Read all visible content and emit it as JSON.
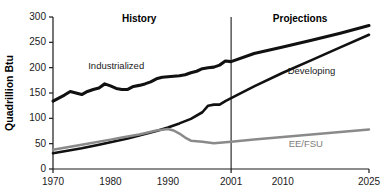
{
  "chart_data": {
    "type": "line",
    "title": "",
    "xlabel": "",
    "ylabel": "Quadrillion Btu",
    "xlim": [
      1970,
      2025
    ],
    "ylim": [
      0,
      300
    ],
    "grid": false,
    "legend_position": "inline-annotations",
    "y_ticks": [
      0,
      50,
      100,
      150,
      200,
      250,
      300
    ],
    "y_tick_labels": [
      "0",
      "50",
      "100",
      "150",
      "200",
      "250",
      "300"
    ],
    "x_ticks": [
      1970,
      1980,
      1990,
      2001,
      2010,
      2025
    ],
    "x_tick_labels": [
      "1970",
      "1980",
      "1990",
      "2001",
      "2010",
      "2025"
    ],
    "annotations": [
      {
        "name": "history-label",
        "text": "History",
        "x": 1985,
        "y": 290
      },
      {
        "name": "projections-label",
        "text": "Projections",
        "x": 2013,
        "y": 290
      },
      {
        "name": "divider-2001",
        "text": "2001",
        "x": 2001
      }
    ],
    "series": [
      {
        "name": "Industrialized",
        "color": "#111111",
        "label_x": 1981,
        "label_y": 198,
        "x": [
          1970,
          1971,
          1972,
          1973,
          1974,
          1975,
          1976,
          1977,
          1978,
          1979,
          1980,
          1981,
          1982,
          1983,
          1984,
          1985,
          1986,
          1987,
          1988,
          1989,
          1990,
          1991,
          1992,
          1993,
          1994,
          1995,
          1996,
          1997,
          1998,
          1999,
          2000,
          2001,
          2005,
          2010,
          2015,
          2020,
          2025
        ],
        "values": [
          134,
          140,
          146,
          153,
          150,
          147,
          153,
          157,
          160,
          168,
          164,
          159,
          157,
          157,
          163,
          165,
          168,
          172,
          178,
          181,
          182,
          183,
          184,
          186,
          190,
          193,
          198,
          200,
          201,
          205,
          213,
          212,
          228,
          241,
          254,
          268,
          283
        ]
      },
      {
        "name": "Developing",
        "color": "#111111",
        "label_x": 2015,
        "label_y": 188,
        "x": [
          1970,
          1973,
          1975,
          1978,
          1980,
          1983,
          1985,
          1988,
          1990,
          1992,
          1994,
          1996,
          1997,
          1998,
          1999,
          2000,
          2001,
          2005,
          2010,
          2015,
          2020,
          2025
        ],
        "values": [
          31,
          37,
          41,
          48,
          53,
          60,
          66,
          75,
          82,
          90,
          99,
          112,
          125,
          127,
          127,
          134,
          140,
          163,
          190,
          215,
          240,
          265
        ]
      },
      {
        "name": "EE/FSU",
        "color": "#8a8a8a",
        "label_x": 2014,
        "label_y": 44,
        "x": [
          1970,
          1975,
          1980,
          1982,
          1985,
          1988,
          1990,
          1991,
          1992,
          1993,
          1994,
          1996,
          1998,
          2000,
          2001,
          2005,
          2010,
          2015,
          2020,
          2025
        ],
        "values": [
          38,
          48,
          58,
          62,
          68,
          76,
          79,
          76,
          70,
          62,
          56,
          54,
          51,
          53,
          54,
          58,
          63,
          68,
          73,
          78
        ]
      }
    ]
  },
  "axis": {
    "y_title": "Quadrillion Btu"
  }
}
